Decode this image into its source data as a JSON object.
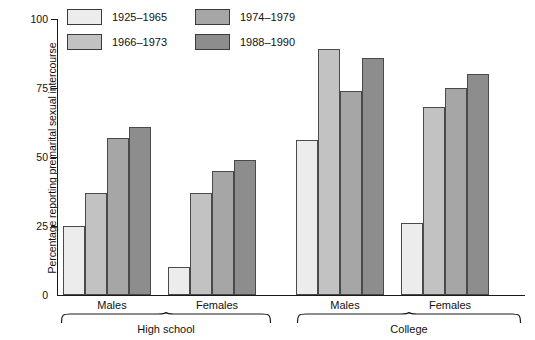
{
  "chart_data": {
    "type": "bar",
    "title": "",
    "xlabel": "",
    "ylabel": "Percentage reporting premarital sexual intercourse",
    "ylim": [
      0,
      100
    ],
    "yticks": [
      0,
      25,
      50,
      75,
      100
    ],
    "grid": false,
    "legend_position": "top-left",
    "categories": [
      "Males",
      "Females",
      "Males",
      "Females"
    ],
    "group_labels": [
      "High school",
      "College"
    ],
    "series": [
      {
        "name": "1925-1965",
        "color": "#ececec",
        "values": [
          25,
          10,
          56,
          26
        ]
      },
      {
        "name": "1966-1973",
        "color": "#c2c2c2",
        "values": [
          37,
          37,
          89,
          68
        ]
      },
      {
        "name": "1974-1979",
        "color": "#a6a6a6",
        "values": [
          57,
          45,
          74,
          75
        ]
      },
      {
        "name": "1988-1990",
        "color": "#8d8d8d",
        "values": [
          61,
          49,
          86,
          80
        ]
      }
    ]
  },
  "axis": {
    "y_title": "Percentage reporting premarital sexual intercourse",
    "tick_0": "0",
    "tick_25": "25",
    "tick_50": "50",
    "tick_75": "75",
    "tick_100": "100"
  },
  "legend": {
    "entries": [
      {
        "label": "1925–1965"
      },
      {
        "label": "1966–1973"
      },
      {
        "label": "1974–1979"
      },
      {
        "label": "1988–1990"
      }
    ]
  },
  "groups": {
    "hs_males": "Males",
    "hs_females": "Females",
    "col_males": "Males",
    "col_females": "Females",
    "high_school": "High school",
    "college": "College"
  }
}
